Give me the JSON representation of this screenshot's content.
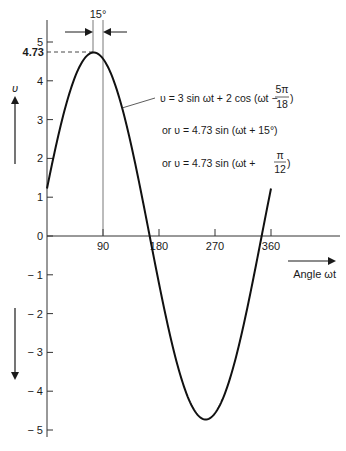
{
  "chart_data": {
    "type": "line",
    "title": "",
    "xlabel": "Angle ωt",
    "ylabel": "υ",
    "xlim": [
      0,
      360
    ],
    "ylim": [
      -5,
      5
    ],
    "x_ticks": [
      "90",
      "180",
      "270",
      "360"
    ],
    "y_ticks": [
      "5",
      "4",
      "3",
      "2",
      "1",
      "0",
      "-1",
      "-2",
      "-3",
      "-4",
      "-5"
    ],
    "grid": false,
    "series": [
      {
        "name": "υ = 4.73 sin(ωt + 15°)",
        "amplitude": 4.73,
        "phase_deg": 15,
        "x": [
          0,
          15,
          30,
          45,
          60,
          75,
          90,
          105,
          120,
          135,
          150,
          165,
          180,
          195,
          210,
          225,
          240,
          255,
          270,
          285,
          300,
          315,
          330,
          345,
          360
        ],
        "values": [
          1.22,
          2.37,
          3.34,
          4.1,
          4.57,
          4.73,
          4.57,
          4.1,
          3.34,
          2.37,
          1.22,
          0.0,
          -1.22,
          -2.37,
          -3.34,
          -4.1,
          -4.57,
          -4.73,
          -4.57,
          -4.1,
          -3.34,
          -2.37,
          -1.22,
          0.0,
          1.22
        ]
      }
    ],
    "annotations": {
      "peak_value_label": "4.73",
      "phase_shift_label": "15°",
      "equation_line1_lhs": "υ = 3 sin ωt + 2 cos (ωt −",
      "equation_line1_frac_num": "5π",
      "equation_line1_frac_den": "18",
      "equation_line1_close": ")",
      "equation_line2": "or  υ = 4.73 sin (ωt + 15°)",
      "equation_line3_lhs": "or  υ = 4.73 sin (ωt +",
      "equation_line3_frac_num": "π",
      "equation_line3_frac_den": "12",
      "equation_line3_close": ")",
      "positive_direction_label": "υ",
      "x_axis_label": "Angle ωt"
    }
  }
}
